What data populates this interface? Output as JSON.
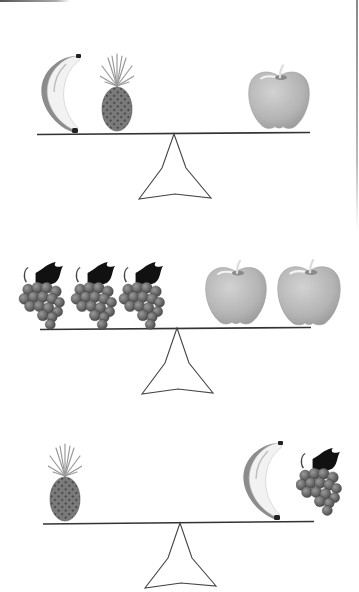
{
  "diagram": {
    "type": "balance-scale-worksheet",
    "colors": {
      "beam": "#333333",
      "fulcrum": "#444444",
      "apple": "#b8b8b8",
      "banana": "#efefef",
      "banana_shadow": "#8a8a8a",
      "pineapple_body": "#6e6e6e",
      "pineapple_leaves": "#b0b0b0",
      "grape": "#6a6a6a",
      "grape_leaf": "#111111"
    },
    "scales": [
      {
        "id": "scale-1",
        "state": "balanced",
        "left_items": [
          "banana-icon",
          "pineapple-icon"
        ],
        "right_items": [
          "apple-icon"
        ]
      },
      {
        "id": "scale-2",
        "state": "balanced",
        "left_items": [
          "grapes-icon",
          "grapes-icon",
          "grapes-icon"
        ],
        "right_items": [
          "apple-icon",
          "apple-icon"
        ]
      },
      {
        "id": "scale-3",
        "state": "balanced",
        "left_items": [
          "pineapple-icon"
        ],
        "right_items": [
          "banana-icon",
          "grapes-icon"
        ]
      }
    ]
  }
}
